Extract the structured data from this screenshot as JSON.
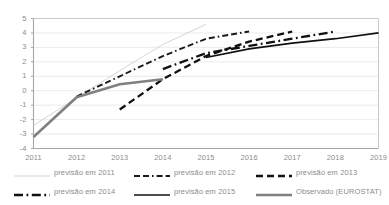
{
  "chart_data": {
    "type": "line",
    "title": "",
    "subtitle": "",
    "xlabel": "",
    "ylabel": "",
    "x": [
      2011,
      2012,
      2013,
      2014,
      2015,
      2016,
      2017,
      2018,
      2019
    ],
    "xtick_labels": [
      "2011",
      "2012",
      "2013",
      "2014",
      "2015",
      "2016",
      "2017",
      "2018",
      "2019"
    ],
    "ytick_labels": [
      "5",
      "4",
      "3",
      "2",
      "1",
      "0",
      "-1",
      "-2",
      "-3",
      "-4"
    ],
    "ylim": [
      -4,
      5
    ],
    "xlim": [
      2011,
      2019
    ],
    "grid": true,
    "grid_axis": "y",
    "legend_position": "bottom",
    "legend_columns": 3,
    "series": [
      {
        "name": "previsão em 2011",
        "style": "solid-thin",
        "color": "#d0d0d0",
        "width": 0.9,
        "x": [
          2011,
          2012,
          2013,
          2014,
          2015
        ],
        "values": [
          -2.4,
          -0.5,
          1.4,
          3.2,
          4.6
        ]
      },
      {
        "name": "previsão em 2012",
        "style": "dash-dash-dot",
        "color": "#1a1a1a",
        "width": 1.9,
        "x": [
          2012,
          2013,
          2014,
          2015,
          2016
        ],
        "values": [
          -0.4,
          1.0,
          2.4,
          3.6,
          4.1
        ]
      },
      {
        "name": "previsão em 2013",
        "style": "dashed-thick",
        "color": "#111111",
        "width": 2.3,
        "x": [
          2013,
          2014,
          2015,
          2016,
          2017
        ],
        "values": [
          -1.3,
          0.8,
          2.4,
          3.4,
          4.1
        ]
      },
      {
        "name": "previsão em 2014",
        "style": "dash-dot-thick",
        "color": "#111111",
        "width": 2.3,
        "x": [
          2014,
          2015,
          2016,
          2017,
          2018
        ],
        "values": [
          1.5,
          2.6,
          3.1,
          3.6,
          4.1
        ]
      },
      {
        "name": "previsão em 2015",
        "style": "solid-thick",
        "color": "#111111",
        "width": 1.7,
        "x": [
          2015,
          2016,
          2017,
          2018,
          2019
        ],
        "values": [
          2.3,
          2.9,
          3.3,
          3.6,
          4.0
        ]
      },
      {
        "name": "Observado (EUROSTAT)",
        "style": "solid-gray-thick",
        "color": "#808080",
        "width": 2.6,
        "x": [
          2011,
          2012,
          2013,
          2014
        ],
        "values": [
          -3.2,
          -0.45,
          0.45,
          0.8
        ]
      }
    ]
  },
  "legend": {
    "items": [
      {
        "label": "previsão em 2011",
        "swatch": "solid-thin",
        "color": "#d0d0d0"
      },
      {
        "label": "previsão em 2012",
        "swatch": "dash-dash-dot",
        "color": "#1a1a1a"
      },
      {
        "label": "previsão em 2013",
        "swatch": "dashed-thick",
        "color": "#111111"
      },
      {
        "label": "previsão em 2014",
        "swatch": "dash-dot-thick",
        "color": "#111111"
      },
      {
        "label": "previsão em 2015",
        "swatch": "solid-thick",
        "color": "#111111"
      },
      {
        "label": "Observado (EUROSTAT)",
        "swatch": "solid-gray-thick",
        "color": "#808080"
      }
    ]
  },
  "plot": {
    "frame_color": "#a6a6a6",
    "grid_color": "#e9e9e9",
    "background": "#ffffff"
  }
}
